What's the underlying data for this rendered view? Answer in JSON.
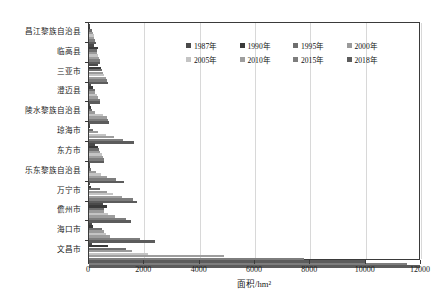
{
  "chart_data": {
    "type": "bar",
    "orientation": "horizontal",
    "title": "",
    "xlabel": "面积/hm²",
    "ylabel": "",
    "xlim": [
      0,
      12000
    ],
    "xticks": [
      0,
      2000,
      4000,
      6000,
      8000,
      10000,
      12000
    ],
    "xticklabels": [
      "0",
      "2000",
      "4000",
      "6000",
      "8000",
      "10000",
      "12000"
    ],
    "grid": true,
    "grid_axis": "x",
    "legend_position": "upper center",
    "categories": [
      "昌江黎族自治县",
      "临高县",
      "三亚市",
      "澄迈县",
      "陵水黎族自治县",
      "琼海市",
      "东方市",
      "乐东黎族自治县",
      "万宁市",
      "儋州市",
      "海口市",
      "文昌市"
    ],
    "series": [
      {
        "name": "1987年",
        "color": "#4a4a4a",
        "values": [
          15,
          180,
          330,
          60,
          40,
          30,
          230,
          10,
          45,
          500,
          110,
          120
        ]
      },
      {
        "name": "1990年",
        "color": "#3a3a3a",
        "values": [
          20,
          320,
          430,
          140,
          60,
          50,
          340,
          20,
          60,
          640,
          150,
          690
        ]
      },
      {
        "name": "1995年",
        "color": "#6e6e6e",
        "values": [
          120,
          300,
          470,
          200,
          120,
          160,
          350,
          60,
          390,
          560,
          470,
          1340
        ]
      },
      {
        "name": "2000年",
        "color": "#9a9a9a",
        "values": [
          140,
          280,
          520,
          230,
          230,
          330,
          410,
          240,
          640,
          540,
          560,
          1570
        ]
      },
      {
        "name": "2005年",
        "color": "#c4c4c4",
        "values": [
          170,
          330,
          560,
          290,
          490,
          620,
          470,
          430,
          880,
          700,
          620,
          2120
        ]
      },
      {
        "name": "2010年",
        "color": "#9e9e9e",
        "values": [
          190,
          360,
          610,
          340,
          640,
          890,
          500,
          640,
          1180,
          950,
          760,
          4880
        ]
      },
      {
        "name": "2015年",
        "color": "#7d7d7d",
        "values": [
          210,
          380,
          650,
          380,
          700,
          1220,
          540,
          960,
          1600,
          1350,
          1830,
          7760
        ]
      },
      {
        "name": "2018年",
        "color": "#5c5c5c",
        "values": [
          240,
          400,
          690,
          400,
          740,
          1610,
          560,
          1280,
          1720,
          1530,
          2380,
          10000
        ]
      }
    ],
    "extra_series_note": {
      "文昌市_extra_bars": [
        11500,
        11950
      ]
    }
  }
}
